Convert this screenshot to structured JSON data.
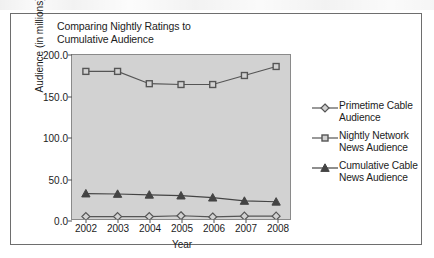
{
  "chart_data": {
    "type": "line",
    "title": "Comparing Nightly Ratings to Cumulative Audience",
    "title_line1": "Comparing Nightly Ratings to",
    "title_line2": "Cumulative Audience",
    "xlabel": "Year",
    "ylabel": "Audience (in millions)",
    "categories": [
      "2002",
      "2003",
      "2004",
      "2005",
      "2006",
      "2007",
      "2008"
    ],
    "x": [
      2002,
      2003,
      2004,
      2005,
      2006,
      2007,
      2008
    ],
    "ylim": [
      0.0,
      200.0
    ],
    "yticks": [
      "0.0",
      "50.0",
      "100.0",
      "150.0",
      "200.0"
    ],
    "ytick_values": [
      0.0,
      50.0,
      100.0,
      150.0,
      200.0
    ],
    "grid": false,
    "legend_position": "right",
    "plot_background": "#d2d2d2",
    "series": [
      {
        "name": "Primetime Cable Audience",
        "label_line1": "Primetime Cable",
        "label_line2": "Audience",
        "marker": "diamond-hollow",
        "color": "#555555",
        "values": [
          3.0,
          3.0,
          3.0,
          4.0,
          2.5,
          3.5,
          3.5
        ]
      },
      {
        "name": "Nightly Network News Audience",
        "label_line1": "Nightly Network",
        "label_line2": "News Audience",
        "marker": "square-hollow",
        "color": "#555555",
        "values": [
          180.0,
          180.0,
          165.0,
          164.0,
          164.0,
          175.0,
          186.0
        ]
      },
      {
        "name": "Cumulative Cable News Audience",
        "label_line1": "Cumulative Cable",
        "label_line2": "News Audience",
        "marker": "triangle-filled",
        "color": "#444444",
        "values": [
          31.0,
          30.5,
          29.5,
          28.5,
          26.0,
          22.0,
          21.0
        ]
      }
    ]
  }
}
